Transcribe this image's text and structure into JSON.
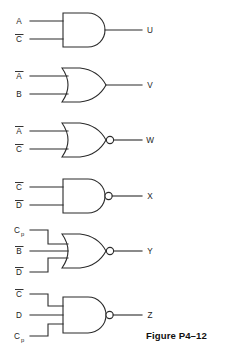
{
  "figure": {
    "caption": "Figure P4–12",
    "gates": [
      {
        "id": "gate-u",
        "type": "AND",
        "inverted_output": false,
        "inputs": [
          {
            "label": "A",
            "overbar": false,
            "subscript": ""
          },
          {
            "label": "C",
            "overbar": true,
            "subscript": ""
          }
        ],
        "output": {
          "label": "U"
        }
      },
      {
        "id": "gate-v",
        "type": "OR",
        "inverted_output": false,
        "inputs": [
          {
            "label": "A",
            "overbar": true,
            "subscript": ""
          },
          {
            "label": "B",
            "overbar": false,
            "subscript": ""
          }
        ],
        "output": {
          "label": "V"
        }
      },
      {
        "id": "gate-w",
        "type": "NOR",
        "inverted_output": true,
        "inputs": [
          {
            "label": "A",
            "overbar": true,
            "subscript": ""
          },
          {
            "label": "C",
            "overbar": true,
            "subscript": ""
          }
        ],
        "output": {
          "label": "W"
        }
      },
      {
        "id": "gate-x",
        "type": "NAND",
        "inverted_output": true,
        "inputs": [
          {
            "label": "C",
            "overbar": true,
            "subscript": ""
          },
          {
            "label": "D",
            "overbar": true,
            "subscript": ""
          }
        ],
        "output": {
          "label": "X"
        }
      },
      {
        "id": "gate-y",
        "type": "NOR",
        "inverted_output": true,
        "inputs": [
          {
            "label": "C",
            "overbar": false,
            "subscript": "p"
          },
          {
            "label": "B",
            "overbar": true,
            "subscript": ""
          },
          {
            "label": "D",
            "overbar": true,
            "subscript": ""
          }
        ],
        "output": {
          "label": "Y"
        }
      },
      {
        "id": "gate-z",
        "type": "NAND",
        "inverted_output": true,
        "inputs": [
          {
            "label": "C",
            "overbar": true,
            "subscript": ""
          },
          {
            "label": "D",
            "overbar": false,
            "subscript": ""
          },
          {
            "label": "C",
            "overbar": false,
            "subscript": "p"
          }
        ],
        "output": {
          "label": "Z"
        }
      }
    ]
  },
  "colors": {
    "line": "#2b2b2b",
    "text": "#1d1d1d",
    "background": "#ffffff"
  }
}
